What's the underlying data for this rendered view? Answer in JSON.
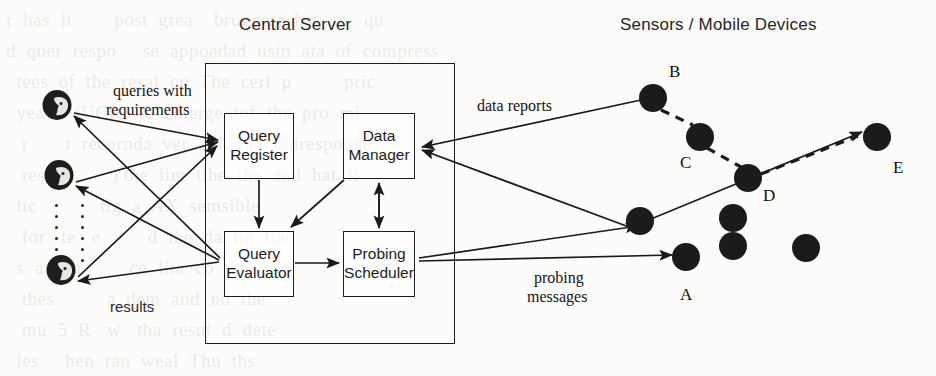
{
  "figure": {
    "title_left": "Central Server",
    "title_right": "Sensors / Mobile Devices",
    "background_color": "#fdfcfa",
    "ink_color": "#1a1a1a"
  },
  "bleed_text": "r  has  it        post  grea    bruggest  hat  an   qu\nd  quer  respo     se  appoadad  usin  ata  of  compress\n  tees  of  the  resal  cu  The  cerl  p          pric\n  yea  a  (UCR)  te  enterge  tof  the  pro  mi\n   r       t  recornda  ver  anl  nnd  coiresponde\n   res  an       ) the  lim  tlhe  the  and  hat  it\n  tic            tig  a  AX  semsible\n   for   te   e         d  the  da  lin  the\n  s  as    a         co  lita  co  the\n   thes          a  dem  and  nd  the\n   mu  5  R   w   tha  resut  d  dete\n  les     hen  ran  weal  Thu  ths\n   do   t  it  drv       alis  olo\n  e  i   PUS  F  tar  hii  The  anl  ind  o\n   lea     th  peal  rtisn  im  par",
  "server": {
    "outer_label": "Central Server",
    "modules": [
      {
        "id": "query-register",
        "line1": "Query",
        "line2": "Register"
      },
      {
        "id": "data-manager",
        "line1": "Data",
        "line2": "Manager"
      },
      {
        "id": "query-evaluator",
        "line1": "Query",
        "line2": "Evaluator"
      },
      {
        "id": "probing-scheduler",
        "line1": "Probing",
        "line2": "Scheduler"
      }
    ]
  },
  "flows": {
    "queries_line1": "queries with",
    "queries_line2": "requirements",
    "results": "results",
    "data_reports": "data reports",
    "probing_line1": "probing",
    "probing_line2": "messages"
  },
  "users": {
    "count": 3,
    "ellipsis_columns": 2,
    "ellipsis_dots": 8
  },
  "sensors": {
    "labeled": [
      {
        "id": "A",
        "label": "A",
        "cx": 686,
        "cy": 257,
        "r": 14,
        "label_x": 681,
        "label_y": 287
      },
      {
        "id": "B",
        "label": "B",
        "cx": 653,
        "cy": 98,
        "r": 14,
        "label_x": 673,
        "label_y": 70
      },
      {
        "id": "C",
        "label": "C",
        "cx": 700,
        "cy": 137,
        "r": 14,
        "label_x": 683,
        "label_y": 157
      },
      {
        "id": "D",
        "label": "D",
        "cx": 748,
        "cy": 178,
        "r": 14,
        "label_x": 764,
        "label_y": 190
      },
      {
        "id": "E",
        "label": "E",
        "cx": 877,
        "cy": 137,
        "r": 14,
        "label_x": 894,
        "label_y": 160
      }
    ],
    "unlabeled": [
      {
        "cx": 640,
        "cy": 221,
        "r": 14
      },
      {
        "cx": 733,
        "cy": 218,
        "r": 14
      },
      {
        "cx": 733,
        "cy": 246,
        "r": 14
      },
      {
        "cx": 806,
        "cy": 248,
        "r": 14
      }
    ]
  },
  "icons": {
    "user": "user-head-icon",
    "sensor": "sensor-node-icon"
  }
}
